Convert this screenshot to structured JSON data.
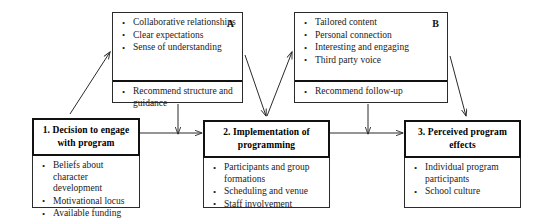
{
  "diagram": {
    "type": "flow-diagram",
    "nodes": {
      "box_a": {
        "label": "A",
        "top_items": [
          "Collaborative relationships",
          "Clear expectations",
          "Sense of understanding"
        ],
        "bottom_items": [
          "Recommend structure and guidance"
        ]
      },
      "box_b": {
        "label": "B",
        "top_items": [
          "Tailored content",
          "Personal connection",
          "Interesting and engaging",
          "Third party voice"
        ],
        "bottom_items": [
          "Recommend follow-up"
        ]
      },
      "box_1": {
        "title": "1. Decision to engage with program",
        "items": [
          "Beliefs about character development",
          "Motivational locus",
          "Available funding"
        ]
      },
      "box_2": {
        "title": "2. Implementation of programming",
        "items": [
          "Participants and group formations",
          "Scheduling and venue",
          "Staff involvement"
        ]
      },
      "box_3": {
        "title": "3. Perceived program effects",
        "items": [
          "Individual program participants",
          "School culture"
        ]
      }
    },
    "colors": {
      "line": "#2b2b2b",
      "text": "#1a1a1a",
      "background": "#ffffff"
    }
  }
}
